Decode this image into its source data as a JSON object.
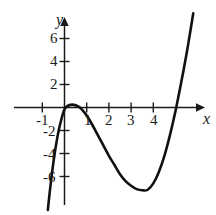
{
  "chart_data": {
    "type": "line",
    "title": "",
    "subtitle": "",
    "xlabel": "x",
    "ylabel": "y",
    "xlim": [
      -1.7,
      6.3
    ],
    "ylim": [
      -9.3,
      8.3
    ],
    "grid": false,
    "legend": null,
    "axis_style": "arrowed-cartesian",
    "x_ticks": [
      -1,
      1,
      2,
      3,
      4
    ],
    "x_tick_labels": [
      "-1",
      "1",
      "2",
      "3",
      "4"
    ],
    "y_ticks": [
      6,
      4,
      2,
      -2,
      -4,
      -6
    ],
    "y_tick_labels": [
      "6",
      "4",
      "2",
      "-2",
      "-4",
      "-6"
    ],
    "curve_description": "Cubic polynomial with a double root near x = 0 and a single root near x = 4.2; local maximum near (0.5, 0.2) and local minimum near (3.8, -7.2).",
    "roots": [
      0,
      0,
      4.2
    ],
    "local_maximum": {
      "x": 0.5,
      "y": 0.2
    },
    "local_minimum": {
      "x": 3.8,
      "y": -7.2
    },
    "series": [
      {
        "name": "cubic",
        "color": "#111111",
        "line_width": 2.6,
        "points": [
          {
            "x": -0.75,
            "y": -8.9
          },
          {
            "x": -0.65,
            "y": -7.1
          },
          {
            "x": -0.55,
            "y": -5.5
          },
          {
            "x": -0.45,
            "y": -4.1
          },
          {
            "x": -0.35,
            "y": -2.9
          },
          {
            "x": -0.25,
            "y": -1.9
          },
          {
            "x": -0.15,
            "y": -1.1
          },
          {
            "x": -0.05,
            "y": -0.4
          },
          {
            "x": 0.05,
            "y": 0.0
          },
          {
            "x": 0.2,
            "y": 0.2
          },
          {
            "x": 0.35,
            "y": 0.25
          },
          {
            "x": 0.5,
            "y": 0.2
          },
          {
            "x": 0.65,
            "y": 0.05
          },
          {
            "x": 0.8,
            "y": -0.2
          },
          {
            "x": 1.0,
            "y": -0.7
          },
          {
            "x": 1.25,
            "y": -1.5
          },
          {
            "x": 1.5,
            "y": -2.4
          },
          {
            "x": 1.75,
            "y": -3.3
          },
          {
            "x": 2.0,
            "y": -4.2
          },
          {
            "x": 2.25,
            "y": -5.0
          },
          {
            "x": 2.5,
            "y": -5.8
          },
          {
            "x": 2.75,
            "y": -6.4
          },
          {
            "x": 3.0,
            "y": -6.8
          },
          {
            "x": 3.25,
            "y": -7.1
          },
          {
            "x": 3.5,
            "y": -7.2
          },
          {
            "x": 3.75,
            "y": -7.15
          },
          {
            "x": 4.0,
            "y": -6.6
          },
          {
            "x": 4.25,
            "y": -5.6
          },
          {
            "x": 4.5,
            "y": -4.2
          },
          {
            "x": 4.75,
            "y": -2.4
          },
          {
            "x": 5.0,
            "y": -0.3
          },
          {
            "x": 5.25,
            "y": 2.1
          },
          {
            "x": 5.5,
            "y": 4.7
          },
          {
            "x": 5.7,
            "y": 7.0
          },
          {
            "x": 5.8,
            "y": 8.2
          }
        ]
      }
    ]
  },
  "axis_labels": {
    "x": "x",
    "y": "y"
  },
  "x_tick_labels": [
    "-1",
    "1",
    "2",
    "3",
    "4"
  ],
  "y_tick_labels": [
    "6",
    "4",
    "2",
    "-2",
    "-4",
    "-6"
  ]
}
